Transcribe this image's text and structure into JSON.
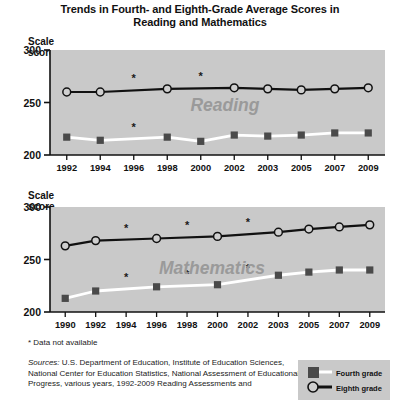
{
  "title": {
    "line1": "Trends in Fourth- and Eighth-Grade Average Scores in",
    "line2": "Reading and Mathematics"
  },
  "axis": {
    "y_label": "Scale score"
  },
  "footnote": "* Data not available",
  "sources": {
    "label": "Sources:",
    "text": " U.S. Department of Education, Institute of Education Sciences, National Center for Education Statistics, National Assessment of Educational Progress, various years, 1992-2009 Reading Assessments and"
  },
  "legend": {
    "items": [
      {
        "label": "Fourth grade",
        "marker": "square",
        "marker_color": "#4a4a4a",
        "line_color": "#ffffff"
      },
      {
        "label": "Eighth grade",
        "marker": "circle",
        "marker_color": "#cfcfcf",
        "line_color": "#111111"
      }
    ]
  },
  "colors": {
    "plot_background": "#c9c9c9",
    "fourth_grade_line": "#ffffff",
    "fourth_grade_marker": "#4a4a4a",
    "eighth_grade_line": "#111111",
    "eighth_grade_marker": "#cfcfcf",
    "watermark": "#9a9a9a"
  },
  "chart_data": [
    {
      "type": "line",
      "title": "Reading",
      "watermark": "Reading",
      "xlabel": "",
      "ylabel": "Scale score",
      "ylim": [
        200,
        300
      ],
      "yticks": [
        200,
        250,
        300
      ],
      "ytick_labels": [
        "200",
        "250",
        "300"
      ],
      "grid": false,
      "legend_position": "bottom-right-external",
      "categories": [
        "1992",
        "1994",
        "1996",
        "1998",
        "2000",
        "2002",
        "2003",
        "2005",
        "2007",
        "2009"
      ],
      "series": [
        {
          "name": "Eighth grade",
          "values": [
            260,
            260,
            null,
            263,
            null,
            264,
            263,
            262,
            263,
            264
          ],
          "marker": "circle"
        },
        {
          "name": "Fourth grade",
          "values": [
            217,
            214,
            null,
            217,
            213,
            219,
            218,
            219,
            221,
            221
          ],
          "marker": "square"
        }
      ],
      "annotations": [
        {
          "text": "*",
          "x": "1996",
          "series": "Eighth grade",
          "meaning": "Data not available"
        },
        {
          "text": "*",
          "x": "2000",
          "series": "Eighth grade",
          "meaning": "Data not available"
        },
        {
          "text": "*",
          "x": "1996",
          "series": "Fourth grade",
          "meaning": "Data not available"
        }
      ]
    },
    {
      "type": "line",
      "title": "Mathematics",
      "watermark": "Mathematics",
      "xlabel": "",
      "ylabel": "Scale score",
      "ylim": [
        200,
        300
      ],
      "yticks": [
        200,
        250,
        300
      ],
      "ytick_labels": [
        "200",
        "250",
        "300"
      ],
      "grid": false,
      "legend_position": "bottom-right-external",
      "categories": [
        "1990",
        "1992",
        "1994",
        "1996",
        "1998",
        "2000",
        "2002",
        "2003",
        "2005",
        "2007",
        "2009"
      ],
      "series": [
        {
          "name": "Eighth grade",
          "values": [
            263,
            268,
            null,
            270,
            null,
            272,
            null,
            276,
            279,
            281,
            283
          ],
          "marker": "circle"
        },
        {
          "name": "Fourth grade",
          "values": [
            213,
            220,
            null,
            224,
            null,
            226,
            null,
            235,
            238,
            240,
            240
          ],
          "marker": "square"
        }
      ],
      "annotations": [
        {
          "text": "*",
          "x": "1994",
          "series": "Eighth grade",
          "meaning": "Data not available"
        },
        {
          "text": "*",
          "x": "1998",
          "series": "Eighth grade",
          "meaning": "Data not available"
        },
        {
          "text": "*",
          "x": "2002",
          "series": "Eighth grade",
          "meaning": "Data not available"
        },
        {
          "text": "*",
          "x": "1994",
          "series": "Fourth grade",
          "meaning": "Data not available"
        },
        {
          "text": "*",
          "x": "1998",
          "series": "Fourth grade",
          "meaning": "Data not available"
        },
        {
          "text": "*",
          "x": "2002",
          "series": "Fourth grade",
          "meaning": "Data not available"
        }
      ]
    }
  ]
}
